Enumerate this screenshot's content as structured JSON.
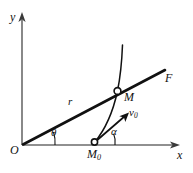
{
  "figure": {
    "kind": "physics-trajectory-diagram",
    "background_color": "#ffffff",
    "ink_color": "#111111",
    "axis_color": "#6b6b6b"
  },
  "axes": {
    "y_label": "y",
    "x_label": "x",
    "origin_label": "O",
    "origin_px": [
      22,
      145
    ],
    "x_axis_end_px": [
      180,
      145
    ],
    "y_axis_top_px": [
      22,
      14
    ]
  },
  "points": {
    "origin": {
      "label": "O",
      "px": [
        22,
        145
      ]
    },
    "launch": {
      "label": "M",
      "subscript": "0",
      "px": [
        94,
        142
      ]
    },
    "current": {
      "label": "M",
      "px": [
        117,
        91
      ]
    }
  },
  "vectors": {
    "radius": {
      "label": "r",
      "from": "O",
      "to": "F-ray",
      "label_px": [
        71,
        101
      ]
    },
    "force_ray": {
      "label": "F",
      "label_px": [
        167,
        79
      ]
    },
    "initial_velocity": {
      "label": "v",
      "subscript": "0",
      "label_px": [
        133,
        113
      ]
    }
  },
  "angles": {
    "theta": {
      "label": "θ",
      "label_px": [
        54,
        131
      ],
      "vertex": "origin",
      "between": [
        "x-axis",
        "r"
      ]
    },
    "alpha": {
      "label": "α",
      "label_px": [
        114,
        130
      ],
      "vertex": "launch",
      "between": [
        "x-axis",
        "v0"
      ]
    }
  },
  "curve": {
    "name": "trajectory",
    "from_px": [
      94,
      142
    ],
    "through_px": [
      117,
      91
    ],
    "to_px": [
      122,
      45
    ]
  }
}
